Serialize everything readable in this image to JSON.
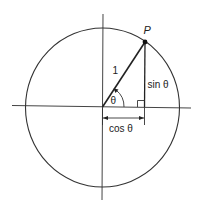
{
  "diagram": {
    "type": "unit-circle-trigonometry",
    "labels": {
      "point": "P",
      "hypotenuse": "1",
      "angle": "θ",
      "opposite": "sin θ",
      "adjacent": "cos θ"
    },
    "colors": {
      "stroke": "#333333",
      "background": "#ffffff"
    }
  }
}
